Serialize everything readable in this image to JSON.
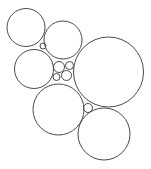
{
  "diagram": {
    "type": "circle-packing",
    "width": 151,
    "height": 169,
    "background": "#ffffff",
    "stroke_color": "#4a4a4a",
    "circles": [
      {
        "id": "top-left",
        "cx": 26,
        "cy": 27.5,
        "r": 19
      },
      {
        "id": "top-middle",
        "cx": 63,
        "cy": 40,
        "r": 19
      },
      {
        "id": "middle-left",
        "cx": 34,
        "cy": 69,
        "r": 19.5
      },
      {
        "id": "large-right",
        "cx": 108.5,
        "cy": 72,
        "r": 35
      },
      {
        "id": "lower-middle",
        "cx": 58.5,
        "cy": 109.5,
        "r": 25.5
      },
      {
        "id": "bottom-right",
        "cx": 104,
        "cy": 134,
        "r": 26
      },
      {
        "id": "small-gap-top",
        "cx": 43,
        "cy": 46,
        "r": 3
      },
      {
        "id": "small-cluster-a",
        "cx": 59,
        "cy": 67,
        "r": 5.5
      },
      {
        "id": "small-cluster-b",
        "cx": 69.5,
        "cy": 65.5,
        "r": 4
      },
      {
        "id": "small-cluster-c",
        "cx": 56.5,
        "cy": 77,
        "r": 3.5
      },
      {
        "id": "small-cluster-d",
        "cx": 66.5,
        "cy": 75.5,
        "r": 5
      },
      {
        "id": "small-gap-bottom",
        "cx": 88,
        "cy": 108,
        "r": 4.5
      }
    ]
  }
}
